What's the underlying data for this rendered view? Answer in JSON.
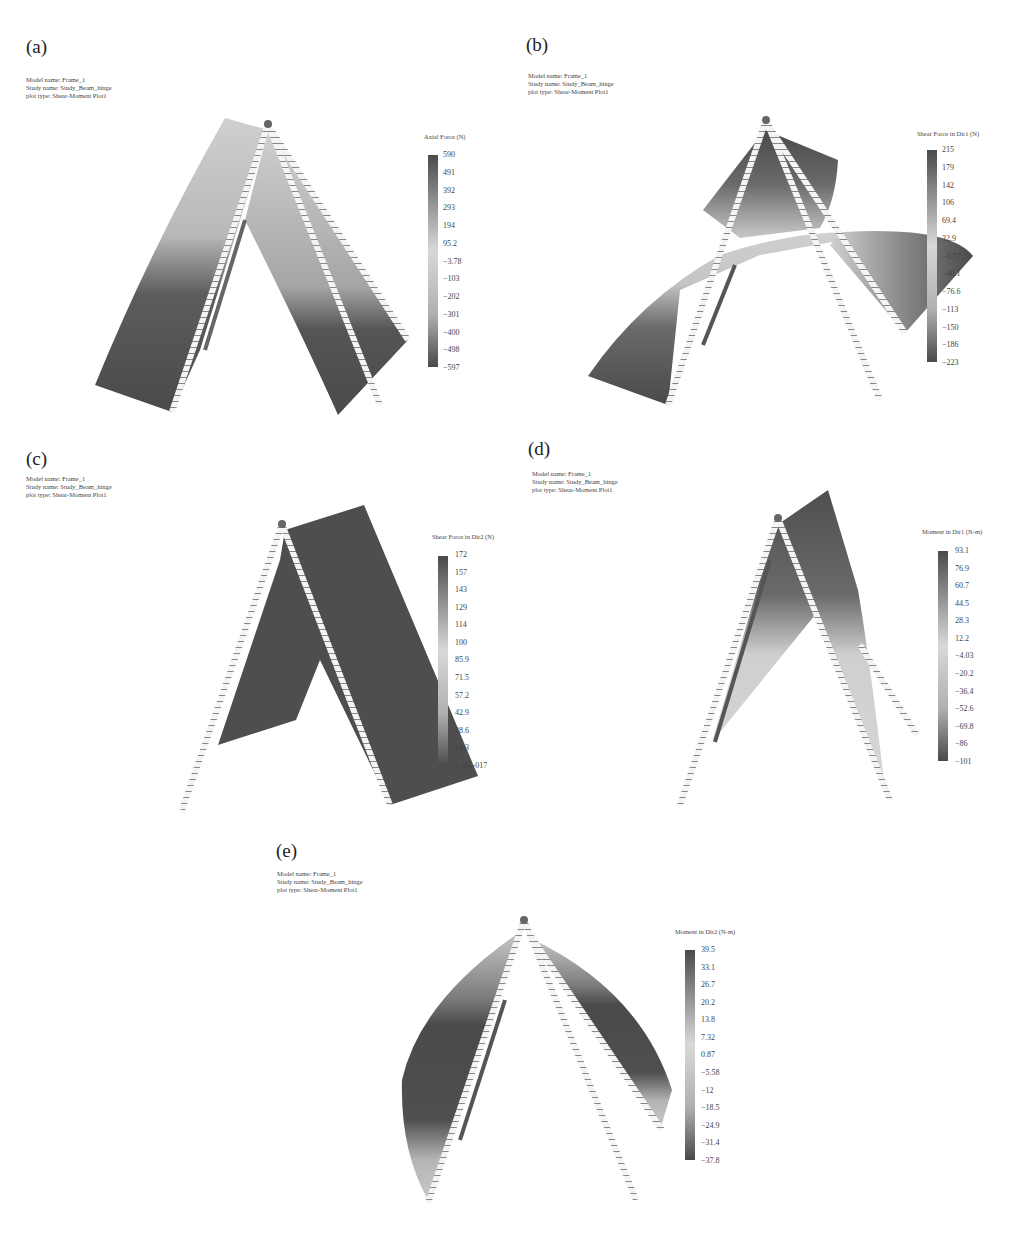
{
  "common": {
    "model_name": "Model name: Frame_1",
    "study_name": "Study name: Study_Beam_hinge",
    "plot_type": "plot type: Shear-Moment Plot1"
  },
  "panels": [
    {
      "label": "(a)",
      "legend_title": "Axial Force (N)",
      "ticks": [
        "590",
        "491",
        "392",
        "293",
        "194",
        "95.2",
        "−3.78",
        "−103",
        "−202",
        "−301",
        "−400",
        "−498",
        "−597"
      ]
    },
    {
      "label": "(b)",
      "legend_title": "Shear Force in Dir1 (N)",
      "ticks": [
        "215",
        "179",
        "142",
        "106",
        "69.4",
        "32.9",
        "−3.57",
        "−40.1",
        "−76.6",
        "−113",
        "−150",
        "−186",
        "−223"
      ]
    },
    {
      "label": "(c)",
      "legend_title": "Shear Force in Dir2 (N)",
      "ticks": [
        "172",
        "157",
        "143",
        "129",
        "114",
        "100",
        "85.9",
        "71.5",
        "57.2",
        "42.9",
        "28.6",
        "14.3",
        "1.36e-017"
      ]
    },
    {
      "label": "(d)",
      "legend_title": "Moment in Dir1 (N-m)",
      "ticks": [
        "93.1",
        "76.9",
        "60.7",
        "44.5",
        "28.3",
        "12.2",
        "−4.03",
        "−20.2",
        "−36.4",
        "−52.6",
        "−69.8",
        "−86",
        "−101"
      ]
    },
    {
      "label": "(e)",
      "legend_title": "Moment in Dir2 (N-m)",
      "ticks": [
        "39.5",
        "33.1",
        "26.7",
        "20.2",
        "13.8",
        "7.32",
        "0.87",
        "−5.58",
        "−12",
        "−18.5",
        "−24.9",
        "−31.4",
        "−37.8"
      ]
    }
  ],
  "colors": {
    "dark": "#4a4a4a",
    "mid": "#9a9a9a",
    "light": "#d4d4d4",
    "beam": "#f2f2f2"
  }
}
